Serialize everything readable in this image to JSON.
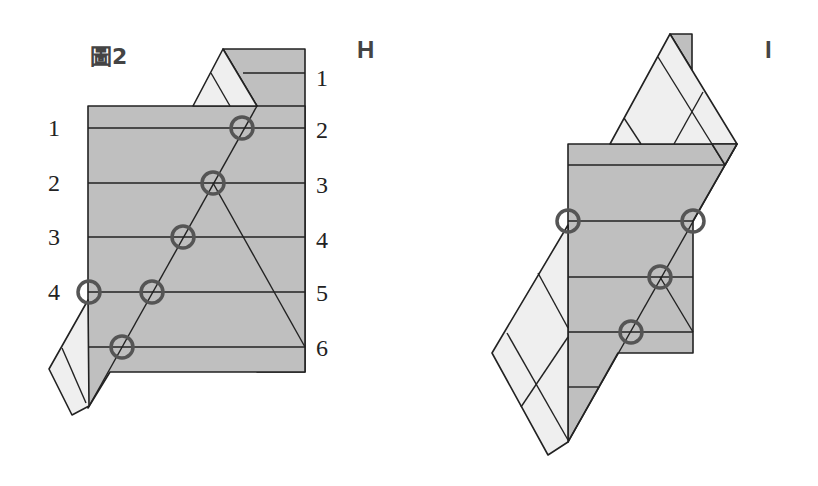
{
  "figure_title": "圖2",
  "panel_h": {
    "label": "H",
    "left_labels": [
      "1",
      "2",
      "3",
      "4"
    ],
    "right_labels": [
      "1",
      "2",
      "3",
      "4",
      "5",
      "6"
    ]
  },
  "panel_i": {
    "label": "I"
  },
  "colors": {
    "paper_gray": "#bfbfbf",
    "paper_light": "#efefef",
    "line": "#222222",
    "circle_marker": "#555555"
  }
}
